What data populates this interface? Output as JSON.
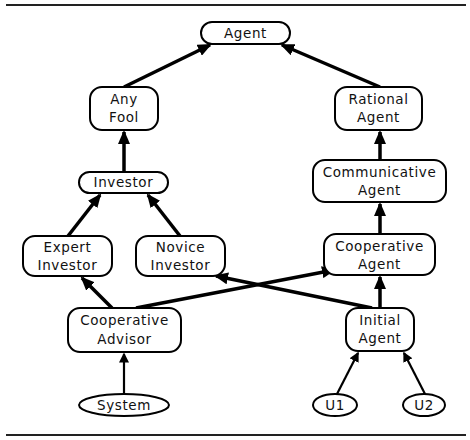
{
  "diagram": {
    "title": "",
    "nodes": {
      "agent": {
        "lines": [
          "Agent"
        ],
        "shape": "rounded-rect"
      },
      "any_fool": {
        "lines": [
          "Any",
          "Fool"
        ],
        "shape": "rounded-rect"
      },
      "rational_agent": {
        "lines": [
          "Rational",
          "Agent"
        ],
        "shape": "rounded-rect"
      },
      "investor": {
        "lines": [
          "Investor"
        ],
        "shape": "rounded-rect"
      },
      "communicative_agent": {
        "lines": [
          "Communicative",
          "Agent"
        ],
        "shape": "rounded-rect"
      },
      "expert_investor": {
        "lines": [
          "Expert",
          "Investor"
        ],
        "shape": "rounded-rect"
      },
      "novice_investor": {
        "lines": [
          "Novice",
          "Investor"
        ],
        "shape": "rounded-rect"
      },
      "cooperative_agent": {
        "lines": [
          "Cooperative",
          "Agent"
        ],
        "shape": "rounded-rect"
      },
      "cooperative_advisor": {
        "lines": [
          "Cooperative",
          "Advisor"
        ],
        "shape": "rounded-rect"
      },
      "initial_agent": {
        "lines": [
          "Initial",
          "Agent"
        ],
        "shape": "rounded-rect"
      },
      "system": {
        "lines": [
          "System"
        ],
        "shape": "ellipse"
      },
      "u1": {
        "lines": [
          "U1"
        ],
        "shape": "ellipse"
      },
      "u2": {
        "lines": [
          "U2"
        ],
        "shape": "ellipse"
      }
    },
    "edges": [
      {
        "from": "Any Fool",
        "to": "Agent"
      },
      {
        "from": "Rational Agent",
        "to": "Agent"
      },
      {
        "from": "Investor",
        "to": "Any Fool"
      },
      {
        "from": "Communicative Agent",
        "to": "Rational Agent"
      },
      {
        "from": "Expert Investor",
        "to": "Investor"
      },
      {
        "from": "Novice Investor",
        "to": "Investor"
      },
      {
        "from": "Cooperative Agent",
        "to": "Communicative Agent"
      },
      {
        "from": "Cooperative Advisor",
        "to": "Expert Investor"
      },
      {
        "from": "Cooperative Advisor",
        "to": "Cooperative Agent"
      },
      {
        "from": "Initial Agent",
        "to": "Novice Investor"
      },
      {
        "from": "Initial Agent",
        "to": "Cooperative Agent"
      },
      {
        "from": "System",
        "to": "Cooperative Advisor"
      },
      {
        "from": "U1",
        "to": "Initial Agent"
      },
      {
        "from": "U2",
        "to": "Initial Agent"
      }
    ],
    "colors": {
      "stroke": "#000000",
      "background": "#ffffff",
      "text": "#111111"
    }
  }
}
